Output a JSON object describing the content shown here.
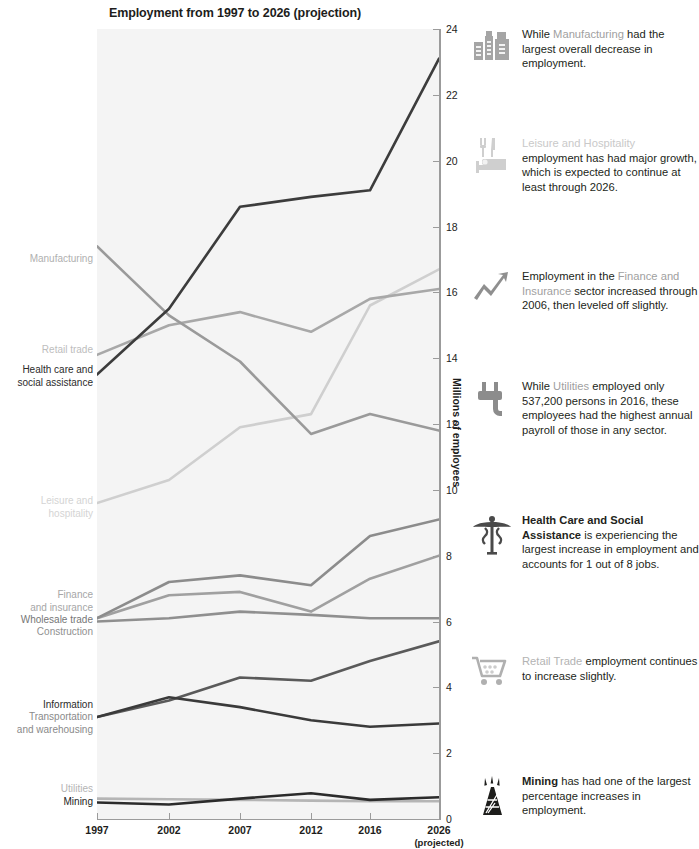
{
  "chart_data": {
    "type": "line",
    "title": "Employment from 1997 to 2026 (projection)",
    "xlabel": "",
    "ylabel": "Millions of employees",
    "categories": [
      "1997",
      "2002",
      "2007",
      "2012",
      "2016",
      "2026"
    ],
    "x_tick_sub": {
      "2026": "(projected)"
    },
    "ylim": [
      0,
      24
    ],
    "yticks": [
      0,
      2,
      4,
      6,
      8,
      10,
      12,
      14,
      16,
      18,
      20,
      22,
      24
    ],
    "grid": false,
    "legend": "inline-left-labels",
    "series": [
      {
        "name": "Health care and social assistance",
        "label": "Health care and\nsocial assistance",
        "color": "#3c3c3c",
        "values": [
          13.5,
          15.5,
          18.6,
          18.9,
          19.1,
          23.1
        ]
      },
      {
        "name": "Manufacturing",
        "label": "Manufacturing",
        "color": "#9a9a9a",
        "values": [
          17.4,
          15.3,
          13.9,
          11.7,
          12.3,
          11.8
        ]
      },
      {
        "name": "Retail trade",
        "label": "Retail trade",
        "color": "#a8a8a8",
        "values": [
          14.1,
          15.0,
          15.4,
          14.8,
          15.8,
          16.1
        ]
      },
      {
        "name": "Leisure and hospitality",
        "label": "Leisure and\nhospitality",
        "color": "#cfcfcf",
        "values": [
          9.6,
          10.3,
          11.9,
          12.3,
          15.6,
          16.7
        ]
      },
      {
        "name": "Finance and insurance",
        "label": "Finance\nand insurance",
        "color": "#8c8c8c",
        "values": [
          6.1,
          7.2,
          7.4,
          7.1,
          8.6,
          9.1
        ]
      },
      {
        "name": "Wholesale trade",
        "label": "Wholesale trade",
        "color": "#a0a0a0",
        "values": [
          6.1,
          6.8,
          6.9,
          6.3,
          7.3,
          8.0
        ]
      },
      {
        "name": "Construction",
        "label": "Construction",
        "color": "#8f8f8f",
        "values": [
          6.0,
          6.1,
          6.3,
          6.2,
          6.1,
          6.1
        ]
      },
      {
        "name": "Transportation and warehousing",
        "label": "Transportation\nand warehousing",
        "color": "#5a5a5a",
        "values": [
          3.1,
          3.6,
          4.3,
          4.2,
          4.8,
          5.4
        ]
      },
      {
        "name": "Information",
        "label": "Information",
        "color": "#3a3a3a",
        "values": [
          3.1,
          3.7,
          3.4,
          3.0,
          2.8,
          2.9
        ]
      },
      {
        "name": "Utilities",
        "label": "Utilities",
        "color": "#b5b5b5",
        "values": [
          0.62,
          0.6,
          0.58,
          0.56,
          0.54,
          0.54
        ]
      },
      {
        "name": "Mining",
        "label": "Mining",
        "color": "#2b2b2b",
        "values": [
          0.5,
          0.44,
          0.62,
          0.78,
          0.58,
          0.66
        ]
      }
    ]
  },
  "axis": {
    "y_title": "Millions of employees",
    "y_labels": [
      "0",
      "2",
      "4",
      "6",
      "8",
      "10",
      "12",
      "14",
      "16",
      "18",
      "20",
      "22",
      "24"
    ],
    "x_labels": [
      "1997",
      "2002",
      "2007",
      "2012",
      "2016",
      "2026"
    ],
    "x_projected_note": "(projected)"
  },
  "series_labels": [
    {
      "id": "manufacturing",
      "text": "Manufacturing",
      "color": "#b0b0b0"
    },
    {
      "id": "retail-trade",
      "text": "Retail trade",
      "color": "#bdbdbd"
    },
    {
      "id": "health-care",
      "text": "Health care and\nsocial assistance",
      "color": "#2b2b2b"
    },
    {
      "id": "leisure",
      "text": "Leisure and\nhospitality",
      "color": "#d4d4d4"
    },
    {
      "id": "finance",
      "text": "Finance\nand insurance",
      "color": "#a6a6a6"
    },
    {
      "id": "wholesale",
      "text": "Wholesale trade",
      "color": "#767676"
    },
    {
      "id": "construction",
      "text": "Construction",
      "color": "#909090"
    },
    {
      "id": "information",
      "text": "Information",
      "color": "#2b2b2b"
    },
    {
      "id": "transportation",
      "text": "Transportation\nand warehousing",
      "color": "#8a8a8a"
    },
    {
      "id": "utilities",
      "text": "Utilities",
      "color": "#b5b5b5"
    },
    {
      "id": "mining",
      "text": "Mining",
      "color": "#1d1d1b"
    }
  ],
  "notes": [
    {
      "icon": "factory-icon",
      "highlight": "Manufacturing",
      "pre": "While ",
      "post": " had the largest overall decrease in employment.",
      "full": "While Manufacturing had the largest overall decrease in employment."
    },
    {
      "icon": "leisure-hospitality-icon",
      "highlight": "Leisure and Hospitality",
      "pre": "",
      "post": " employment has had major growth, which is expected to continue at least through 2026.",
      "full": "Leisure and Hospitality employment has had major growth, which is expected to continue at least through 2026."
    },
    {
      "icon": "growth-arrow-icon",
      "highlight": "Finance and Insurance",
      "pre": "Employment in the ",
      "post": " sector increased through 2006, then leveled off slightly.",
      "full": "Employment in the Finance and Insurance sector increased through 2006, then leveled off slightly."
    },
    {
      "icon": "power-plug-icon",
      "highlight": "Utilities",
      "pre": "While ",
      "post": " employed only 537,200 persons in 2016, these employees had the highest annual payroll of those in any sector.",
      "full": "While Utilities employed only 537,200 persons in 2016, these employees had the highest annual payroll of those in any sector."
    },
    {
      "icon": "caduceus-icon",
      "highlight": "Health Care and Social Assistance",
      "pre": "",
      "post": " is experiencing the largest increase in employment and accounts for 1 out of 8 jobs.",
      "full": "Health Care and Social Assistance is experiencing the largest increase in employment and accounts for 1 out of 8 jobs."
    },
    {
      "icon": "shopping-cart-icon",
      "highlight": "Retail Trade",
      "pre": "",
      "post": " employment continues to increase slightly.",
      "full": "Retail Trade employment continues to increase slightly."
    },
    {
      "icon": "oil-derrick-icon",
      "highlight": "Mining",
      "pre": "",
      "post": " has had one of the largest percentage increases in employment.",
      "full": "Mining has had one of the largest percentage increases in employment."
    }
  ],
  "colors": {
    "plot_background": "#f4f4f4",
    "axis": "#9b9b9b",
    "text": "#231f20",
    "muted": "#b3b3b3"
  }
}
